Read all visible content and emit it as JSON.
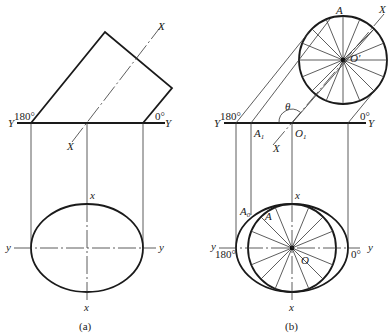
{
  "figure_a": {
    "caption": "(a)",
    "labels": {
      "axis_X_top": "X",
      "axis_X_bottom": "X",
      "axis_Y_left": "Y",
      "axis_Y_right": "Y",
      "angle_180": "180°",
      "angle_0": "0°",
      "axis_x_top": "x",
      "axis_x_bottom": "x",
      "axis_y_left": "y",
      "axis_y_right": "y"
    }
  },
  "figure_b": {
    "caption": "(b)",
    "labels": {
      "point_A_top": "A",
      "axis_X_top": "X",
      "center_O_prime": "O'",
      "theta": "θ",
      "axis_Y_left": "Y",
      "axis_Y_right": "Y",
      "angle_180_top": "180°",
      "angle_0_top": "0°",
      "point_A1": "A",
      "point_A1_sub": "1",
      "point_O1": "O",
      "point_O1_sub": "1",
      "axis_X_bottom": "X",
      "axis_x_top": "x",
      "axis_x_bottom": "x",
      "point_A0": "A",
      "point_A0_sub": "0",
      "point_A_bottom": "A",
      "axis_y_left": "y",
      "axis_y_right": "y",
      "angle_180_bottom": "180°",
      "angle_0_bottom": "0°",
      "center_O": "O"
    }
  }
}
